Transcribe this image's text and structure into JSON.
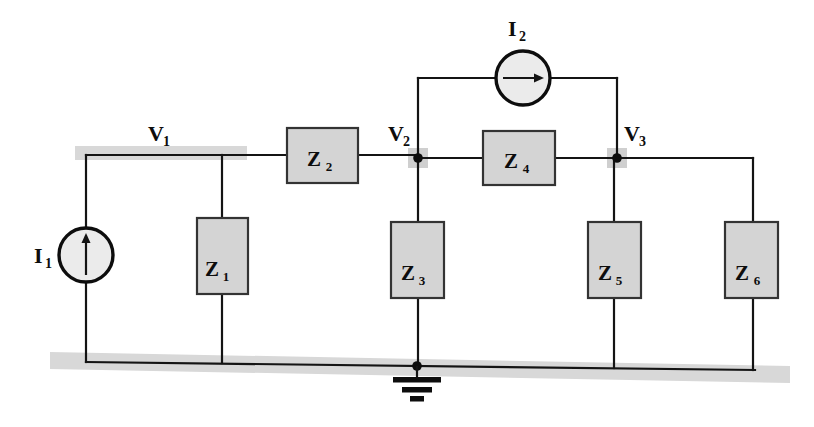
{
  "diagram": {
    "type": "circuit-schematic",
    "colors": {
      "background": "#ffffff",
      "wire": "#141414",
      "component_fill": "#d4d4d4",
      "component_stroke": "#333333",
      "source_fill": "#ebebeb",
      "highlight_band": "#d8d8d8",
      "node_highlight": "#cfcfcf",
      "text": "#0d0d0d"
    }
  },
  "sources": [
    {
      "id": "I1",
      "label_main": "I",
      "label_sub": "1",
      "shape": "circle",
      "arrow_direction": "up",
      "center_x": 86,
      "center_y": 255,
      "radius": 27,
      "label_x": 42,
      "label_y": 262
    },
    {
      "id": "I2",
      "label_main": "I",
      "label_sub": "2",
      "shape": "circle",
      "arrow_direction": "right",
      "center_x": 523,
      "center_y": 78,
      "radius": 27,
      "label_x": 511,
      "label_y": 35
    }
  ],
  "impedances": [
    {
      "id": "Z1",
      "label_main": "Z",
      "label_sub": "1",
      "orientation": "vertical",
      "x": 197,
      "y": 218,
      "w": 51,
      "h": 76,
      "text_x": 222,
      "text_y": 268
    },
    {
      "id": "Z2",
      "label_main": "Z",
      "label_sub": "2",
      "orientation": "horizontal",
      "x": 287,
      "y": 128,
      "w": 71,
      "h": 55,
      "text_x": 322,
      "text_y": 164
    },
    {
      "id": "Z3",
      "label_main": "Z",
      "label_sub": "3",
      "orientation": "vertical",
      "x": 391,
      "y": 222,
      "w": 53,
      "h": 76,
      "text_x": 417,
      "text_y": 272
    },
    {
      "id": "Z4",
      "label_main": "Z",
      "label_sub": "4",
      "orientation": "horizontal",
      "x": 483,
      "y": 131,
      "w": 72,
      "h": 54,
      "text_x": 519,
      "text_y": 166
    },
    {
      "id": "Z5",
      "label_main": "Z",
      "label_sub": "5",
      "orientation": "vertical",
      "x": 588,
      "y": 222,
      "w": 53,
      "h": 76,
      "text_x": 614,
      "text_y": 272
    },
    {
      "id": "Z6",
      "label_main": "Z",
      "label_sub": "6",
      "orientation": "vertical",
      "x": 725,
      "y": 222,
      "w": 53,
      "h": 76,
      "text_x": 751,
      "text_y": 272
    }
  ],
  "nodes": [
    {
      "id": "V1",
      "label_main": "V",
      "label_sub": "1",
      "label_x": 152,
      "label_y": 140,
      "highlight": {
        "type": "band",
        "x": 75,
        "y": 146,
        "w": 172,
        "h": 14
      },
      "dot": null
    },
    {
      "id": "V2",
      "label_main": "V",
      "label_sub": "2",
      "label_x": 392,
      "label_y": 140,
      "highlight": {
        "type": "square",
        "x": 408,
        "y": 148,
        "w": 20,
        "h": 20
      },
      "dot": {
        "x": 418,
        "y": 158,
        "r": 4.5
      }
    },
    {
      "id": "V3",
      "label_main": "V",
      "label_sub": "3",
      "label_x": 625,
      "label_y": 140,
      "highlight": {
        "type": "square",
        "x": 607,
        "y": 148,
        "w": 20,
        "h": 20
      },
      "dot": {
        "x": 617,
        "y": 158,
        "r": 4.5
      }
    }
  ],
  "ground": {
    "id": "ground",
    "x": 417,
    "y_top": 366,
    "dot": {
      "x": 417,
      "y": 366,
      "r": 4.5
    },
    "bars": [
      {
        "y": 380,
        "half_width": 24,
        "thickness": 5
      },
      {
        "y": 390,
        "half_width": 15,
        "thickness": 5
      },
      {
        "y": 399,
        "half_width": 7,
        "thickness": 5
      }
    ]
  },
  "rails": {
    "top_y": 155,
    "bottom_left_x": 86,
    "bottom_left_y": 362,
    "bottom_right_x": 755,
    "bottom_right_y": 370,
    "bottom_band": {
      "x1": 50,
      "y1": 358,
      "x2": 790,
      "y2": 373,
      "thickness": 17
    }
  }
}
